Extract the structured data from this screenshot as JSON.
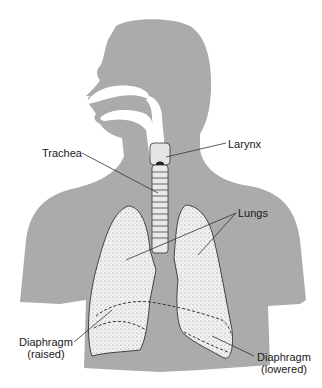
{
  "diagram": {
    "type": "anatomical-illustration",
    "colors": {
      "silhouette": "#ababab",
      "lung_fill": "#f1f1f1",
      "lung_stipple": "#8a8a8a",
      "outline": "#333333",
      "leader_line": "#333333"
    },
    "labels": {
      "larynx": "Larynx",
      "trachea": "Trachea",
      "lungs": "Lungs",
      "diaphragm_raised_line1": "Diaphragm",
      "diaphragm_raised_line2": "(raised)",
      "diaphragm_lowered_line1": "Diaphragm",
      "diaphragm_lowered_line2": "(lowered)"
    }
  }
}
